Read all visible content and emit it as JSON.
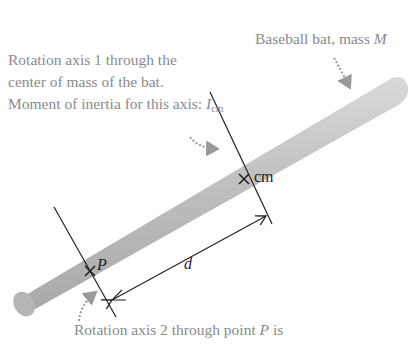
{
  "top_cut_text": "...",
  "labels": {
    "bat": "Baseball bat, mass ",
    "bat_mass_symbol": "M",
    "axis1_line1": "Rotation axis 1 through the",
    "axis1_line2": "center of mass of the bat.",
    "axis1_line3": "Moment of inertia for this axis: ",
    "axis1_symbol": "I",
    "axis1_sub": "cm",
    "axis2_prefix": "Rotation axis 2 through point ",
    "axis2_point": "P",
    "axis2_suffix": " is",
    "cm_marker": "cm",
    "p_marker": "P",
    "distance": "d"
  },
  "colors": {
    "bat": "#c8c8c8",
    "label_gray": "#8a8a8a",
    "line": "#222222"
  }
}
